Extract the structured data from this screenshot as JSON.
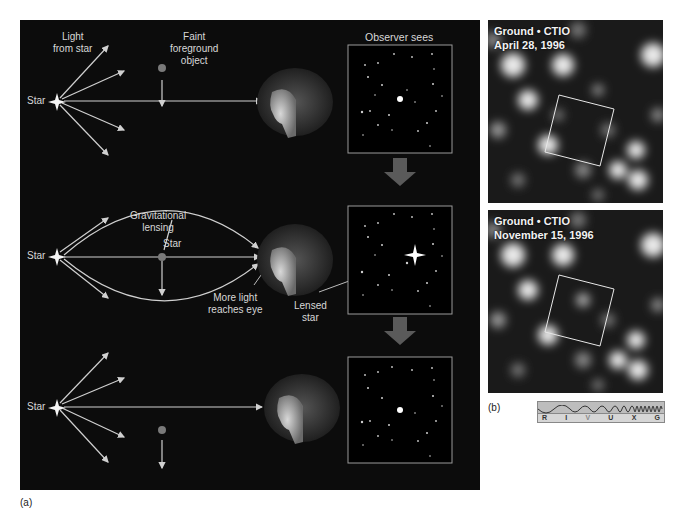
{
  "panel_a": {
    "caption": "(a)",
    "row1": {
      "light_from_star": [
        "Light",
        "from star"
      ],
      "star_label": "Star",
      "foreground_object": [
        "Faint",
        "foreground",
        "object"
      ],
      "observer_sees": "Observer sees"
    },
    "row2": {
      "star_label": "Star",
      "gravitational_lensing": [
        "Gravitational",
        "lensing"
      ],
      "lens_star_label": "Star",
      "more_light": [
        "More light",
        "reaches eye"
      ],
      "lensed_star": [
        "Lensed",
        "star"
      ]
    },
    "row3": {
      "star_label": "Star"
    },
    "colors": {
      "background": "#0c0c0c",
      "rays": "#d0d0d0",
      "foreground_object": "#7a7a7a",
      "transition_arrow": "#5a5a5a"
    }
  },
  "panel_b": {
    "caption": "(b)",
    "images": [
      {
        "line1": "Ground • CTIO",
        "line2": "April 28, 1996"
      },
      {
        "line1": "Ground • CTIO",
        "line2": "November 15, 1996"
      }
    ],
    "spectrum_bands": [
      "R",
      "I",
      "V",
      "U",
      "X",
      "G"
    ],
    "highlighted_band": "I"
  }
}
